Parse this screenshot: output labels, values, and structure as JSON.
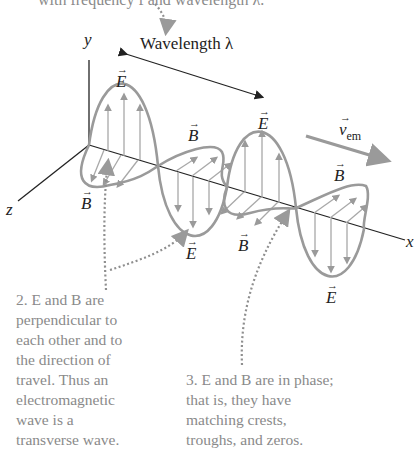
{
  "header": {
    "caption_fragment": "with frequency f and wavelength λ."
  },
  "axes": {
    "y_label": "y",
    "z_label": "z",
    "x_label": "x"
  },
  "annotations": {
    "wavelength_label": "Wavelength λ",
    "velocity_symbol": "v",
    "velocity_subscript": "em",
    "E_symbol": "E",
    "B_symbol": "B",
    "vector_arrow": "→"
  },
  "captions": {
    "note2": {
      "lines": [
        "2. E and B are",
        "perpendicular to",
        "each other and to",
        "the direction of",
        "travel. Thus an",
        "electromagnetic",
        "wave is a",
        "transverse wave."
      ]
    },
    "note3": {
      "lines": [
        "3. E and B are in phase;",
        "that is, they have",
        "matching crests,",
        "troughs, and zeros."
      ]
    }
  },
  "colors": {
    "wave": "#9a9a9a",
    "axis": "#222222",
    "caption": "#8a8a8a",
    "dotted": "#8f8f8f"
  }
}
